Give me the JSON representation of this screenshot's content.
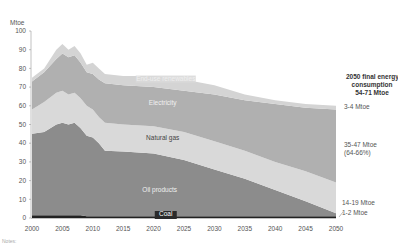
{
  "chart_data": {
    "type": "area",
    "stacked": true,
    "title": "",
    "ylabel": "Mtoe",
    "xlabel": "",
    "ylim": [
      0,
      100
    ],
    "xlim": [
      2000,
      2050
    ],
    "yticks": [
      0,
      10,
      20,
      30,
      40,
      50,
      60,
      70,
      80,
      90,
      100
    ],
    "xticks": [
      2000,
      2005,
      2010,
      2015,
      2020,
      2025,
      2030,
      2035,
      2040,
      2045,
      2050
    ],
    "grid": false,
    "x": [
      2000,
      2002,
      2004,
      2005,
      2006,
      2007,
      2008,
      2009,
      2010,
      2011,
      2012,
      2015,
      2020,
      2025,
      2030,
      2035,
      2040,
      2045,
      2050
    ],
    "series": [
      {
        "name": "Coal",
        "color": "#222222",
        "label_color": "#ffffff",
        "values": [
          1.5,
          1.5,
          1.5,
          1.5,
          1.5,
          1.5,
          1.5,
          1,
          1,
          1,
          1,
          1,
          1,
          1,
          1,
          1,
          1,
          1,
          1
        ]
      },
      {
        "name": "Oil products",
        "color": "#8c8c8c",
        "label_color": "#f0f0f0",
        "values": [
          43.5,
          44.5,
          48.5,
          49.5,
          48.5,
          49.5,
          46.5,
          43,
          42,
          39,
          35,
          34.5,
          33.5,
          30,
          25,
          20,
          14,
          8,
          1.5
        ]
      },
      {
        "name": "Natural gas",
        "color": "#d9d9d9",
        "label_color": "#444444",
        "values": [
          13,
          16,
          17,
          17,
          16,
          16,
          16,
          16,
          15,
          14,
          15,
          14.5,
          14.5,
          15,
          15,
          15,
          15,
          16,
          16.5
        ]
      },
      {
        "name": "Electricity",
        "color": "#b0b0b0",
        "label_color": "#f0f0f0",
        "values": [
          15,
          16,
          18,
          20,
          20,
          20,
          19,
          18,
          19,
          20,
          21,
          21,
          21,
          22,
          25,
          27,
          31,
          34,
          39
        ]
      },
      {
        "name": "End-use renewables",
        "color": "#d4d4d4",
        "label_color": "#eeeeee",
        "values": [
          2,
          2,
          5,
          5,
          4,
          5,
          5,
          4,
          6,
          6,
          5,
          5,
          6,
          6,
          5,
          3,
          2,
          2,
          2
        ]
      }
    ],
    "annotations": {
      "total_2050": [
        "2050 final energy",
        "consumption",
        "54-71 Mtoe"
      ],
      "renewables_2050": "3-4 Mtoe",
      "electricity_2050": [
        "35-47 Mtoe",
        "(64-66%)"
      ],
      "oil_2050": "14-19 Mtoe",
      "coal_2050": "1-2 Mtoe"
    }
  },
  "footnote": "Notes:"
}
